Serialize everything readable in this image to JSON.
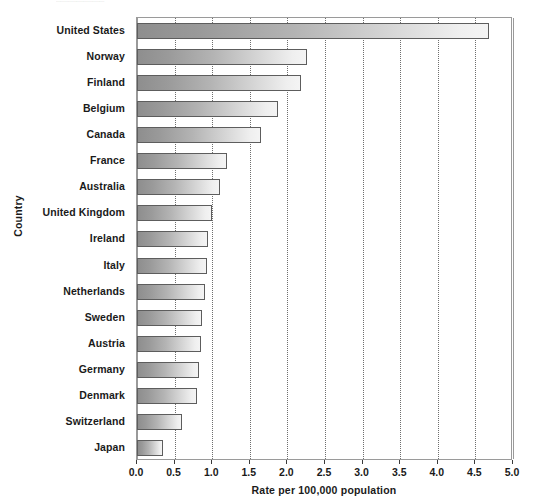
{
  "caption_fragment": "........................................",
  "chart_data": {
    "type": "bar",
    "orientation": "horizontal",
    "title": "",
    "xlabel": "Rate per 100,000 population",
    "ylabel": "Country",
    "xlim": [
      0.0,
      5.0
    ],
    "xticks": [
      "0.0",
      "0.5",
      "1.0",
      "1.5",
      "2.0",
      "2.5",
      "3.0",
      "3.5",
      "4.0",
      "4.5",
      "5.0"
    ],
    "xtick_values": [
      0.0,
      0.5,
      1.0,
      1.5,
      2.0,
      2.5,
      3.0,
      3.5,
      4.0,
      4.5,
      5.0
    ],
    "grid": "vertical-dotted",
    "legend": "none",
    "bar_style": {
      "fill_start": "#8e8e8e",
      "fill_end": "#f4f4f4",
      "border": "#5d5d5d"
    },
    "categories": [
      "United States",
      "Norway",
      "Finland",
      "Belgium",
      "Canada",
      "France",
      "Australia",
      "United Kingdom",
      "Ireland",
      "Italy",
      "Netherlands",
      "Sweden",
      "Austria",
      "Germany",
      "Denmark",
      "Switzerland",
      "Japan"
    ],
    "values": [
      4.68,
      2.26,
      2.18,
      1.88,
      1.65,
      1.2,
      1.1,
      1.0,
      0.95,
      0.93,
      0.9,
      0.87,
      0.85,
      0.82,
      0.8,
      0.6,
      0.35
    ]
  }
}
